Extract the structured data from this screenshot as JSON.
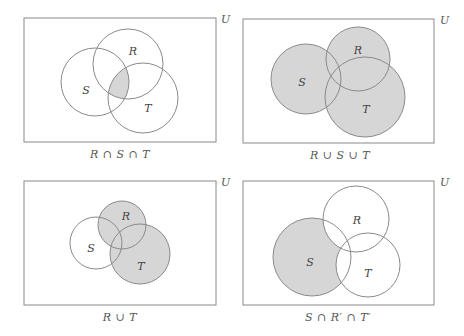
{
  "colors": {
    "stroke": "#8a8a8a",
    "shade": "#d6d6d6",
    "background": "#ffffff",
    "text": "#555555"
  },
  "universe_label": "U",
  "panels": [
    {
      "id": "intersection-all",
      "caption": "R ∩ S ∩ T",
      "rect": {
        "x": 24,
        "y": 18,
        "w": 192,
        "h": 124
      },
      "u_pos": {
        "x": 221,
        "y": 16
      },
      "caption_pos": {
        "x": 120,
        "y": 150
      },
      "circles": {
        "S": {
          "cx": 95,
          "cy": 82,
          "r": 34
        },
        "R": {
          "cx": 128,
          "cy": 64,
          "r": 35
        },
        "T": {
          "cx": 143,
          "cy": 98,
          "r": 35
        }
      },
      "labels": {
        "R": {
          "text": "R",
          "x": 133,
          "y": 51
        },
        "S": {
          "text": "S",
          "x": 86,
          "y": 90
        },
        "T": {
          "text": "T",
          "x": 148,
          "y": 108
        }
      },
      "shaded_region": "R ∩ S ∩ T"
    },
    {
      "id": "union-all",
      "caption": "R ∪ S ∪ T",
      "rect": {
        "x": 243,
        "y": 19,
        "w": 191,
        "h": 124
      },
      "u_pos": {
        "x": 440,
        "y": 17
      },
      "caption_pos": {
        "x": 340,
        "y": 151
      },
      "circles": {
        "S": {
          "cx": 306,
          "cy": 79,
          "r": 35
        },
        "R": {
          "cx": 358,
          "cy": 59,
          "r": 32
        },
        "T": {
          "cx": 365,
          "cy": 97,
          "r": 40
        }
      },
      "labels": {
        "R": {
          "text": "R",
          "x": 358,
          "y": 50
        },
        "S": {
          "text": "S",
          "x": 302,
          "y": 82
        },
        "T": {
          "text": "T",
          "x": 366,
          "y": 109
        }
      },
      "shaded_region": "R ∪ S ∪ T"
    },
    {
      "id": "union-rt",
      "caption": "R ∪ T",
      "rect": {
        "x": 24,
        "y": 181,
        "w": 192,
        "h": 124
      },
      "u_pos": {
        "x": 221,
        "y": 179
      },
      "caption_pos": {
        "x": 120,
        "y": 312
      },
      "circles": {
        "S": {
          "cx": 96,
          "cy": 243,
          "r": 26
        },
        "R": {
          "cx": 122,
          "cy": 225,
          "r": 24
        },
        "T": {
          "cx": 140,
          "cy": 254,
          "r": 30
        }
      },
      "labels": {
        "R": {
          "text": "R",
          "x": 126,
          "y": 216
        },
        "S": {
          "text": "S",
          "x": 91,
          "y": 248
        },
        "T": {
          "text": "T",
          "x": 141,
          "y": 266
        }
      },
      "shaded_region": "R ∪ T"
    },
    {
      "id": "s-only",
      "caption": "S ∩ R′ ∩ T′",
      "rect": {
        "x": 243,
        "y": 181,
        "w": 191,
        "h": 124
      },
      "u_pos": {
        "x": 440,
        "y": 179
      },
      "caption_pos": {
        "x": 338,
        "y": 312
      },
      "circles": {
        "S": {
          "cx": 312,
          "cy": 257,
          "r": 39
        },
        "R": {
          "cx": 356,
          "cy": 219,
          "r": 33
        },
        "T": {
          "cx": 368,
          "cy": 265,
          "r": 32
        }
      },
      "labels": {
        "R": {
          "text": "R",
          "x": 357,
          "y": 220
        },
        "S": {
          "text": "S",
          "x": 310,
          "y": 262
        },
        "T": {
          "text": "T",
          "x": 368,
          "y": 273
        }
      },
      "shaded_region": "S ∩ R′ ∩ T′"
    }
  ]
}
